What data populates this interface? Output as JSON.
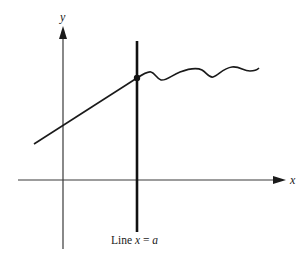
{
  "diagram": {
    "axes": {
      "x_label": "x",
      "y_label": "y"
    },
    "vertical_line": {
      "label_prefix": "Line ",
      "label_var": "x",
      "label_eq": " = ",
      "label_val": "a"
    },
    "elements": [
      "y-axis with upward arrow",
      "x-axis with rightward arrow",
      "thick vertical line at x = a",
      "straight line segment approaching from left, ending at a point on x = a",
      "filled dot at intersection",
      "wavy curve continuing to the right of x = a"
    ],
    "colors": {
      "ink": "#1a1a1a",
      "axis": "#3a3a3a",
      "background": "#ffffff"
    }
  }
}
